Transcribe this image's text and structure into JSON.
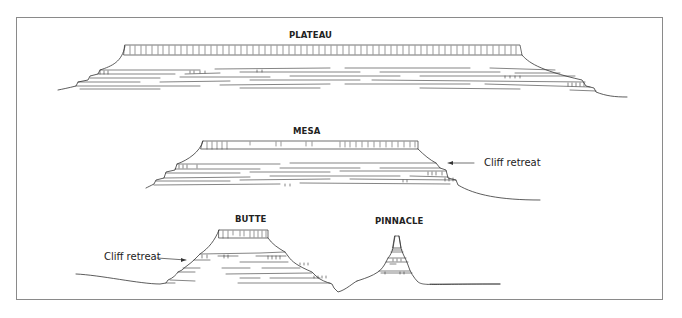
{
  "figure": {
    "landforms": [
      {
        "id": "plateau",
        "title": "PLATEAU"
      },
      {
        "id": "mesa",
        "title": "MESA"
      },
      {
        "id": "butte",
        "title": "BUTTE"
      },
      {
        "id": "pinnacle",
        "title": "PINNACLE"
      }
    ],
    "annotations": {
      "mesa_cliff": "Cliff retreat",
      "butte_cliff": "Cliff retreat"
    },
    "colors": {
      "line": "#333333",
      "frame": "#8a8a8a",
      "background": "#ffffff"
    }
  }
}
